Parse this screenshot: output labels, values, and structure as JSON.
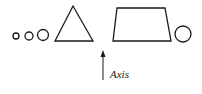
{
  "diagram": {
    "stroke_color": "#1a1a1a",
    "background": "#ffffff",
    "shapes": [
      {
        "type": "circle",
        "name": "small-circle-1",
        "cx": 16,
        "cy": 36,
        "r": 3
      },
      {
        "type": "circle",
        "name": "small-circle-2",
        "cx": 29,
        "cy": 36,
        "r": 4
      },
      {
        "type": "circle",
        "name": "small-circle-3",
        "cx": 43,
        "cy": 35,
        "r": 5.5
      },
      {
        "type": "polygon",
        "name": "triangle",
        "points": "73,6 55,41 93,41"
      },
      {
        "type": "polygon",
        "name": "trapezoid",
        "points": "117,8 165,8 171,41 113,41"
      },
      {
        "type": "circle",
        "name": "right-circle",
        "cx": 183,
        "cy": 34,
        "r": 8
      }
    ],
    "arrow": {
      "x": 103,
      "y_start": 80,
      "y_end": 50
    },
    "axis_label": "Axis"
  }
}
